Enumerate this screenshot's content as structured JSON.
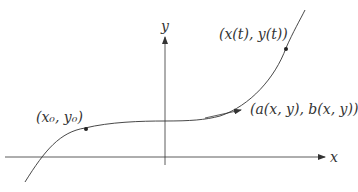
{
  "diagram": {
    "type": "parametric curve with tangent vector field",
    "axes": {
      "x_label": "x",
      "y_label": "y"
    },
    "labels": {
      "start_point": "(x₀, y₀)",
      "moving_point": "(x(t), y(t))",
      "vector": "(a(x, y), b(x, y))"
    },
    "colors": {
      "stroke": "#333333",
      "background": "#ffffff"
    }
  }
}
